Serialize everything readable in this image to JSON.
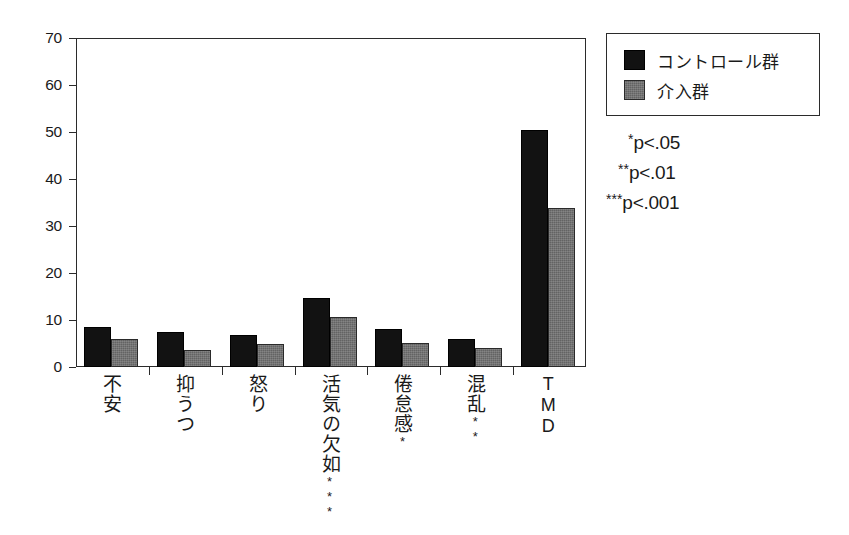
{
  "chart_data": {
    "type": "bar",
    "title": "",
    "xlabel": "",
    "ylabel": "",
    "ylim": [
      0,
      70
    ],
    "ytick_step": 10,
    "grid": false,
    "legend_position": "top-right",
    "categories": [
      "不安",
      "抑うつ",
      "怒り",
      "活気の欠如",
      "倦怠感",
      "混乱",
      "TMD"
    ],
    "category_significance": [
      "",
      "",
      "",
      "***",
      "*",
      "**",
      ""
    ],
    "yticks": [
      "0",
      "10",
      "20",
      "30",
      "40",
      "50",
      "60",
      "70"
    ],
    "series": [
      {
        "name": "コントロール群",
        "color": "#121212",
        "values": [
          8.5,
          7.5,
          6.9,
          14.7,
          8.0,
          6.0,
          50.5
        ]
      },
      {
        "name": "介入群",
        "color": "#636363",
        "values": [
          6.0,
          3.7,
          5.0,
          10.6,
          5.2,
          4.0,
          33.8
        ]
      }
    ],
    "annotations": [
      {
        "stars": "*",
        "text": "p<.05"
      },
      {
        "stars": "**",
        "text": "p<.01"
      },
      {
        "stars": "***",
        "text": "p<.001"
      }
    ]
  },
  "legend": {
    "items": [
      {
        "label": "コントロール群",
        "swatch": "control"
      },
      {
        "label": "介入群",
        "swatch": "intervention"
      }
    ]
  }
}
